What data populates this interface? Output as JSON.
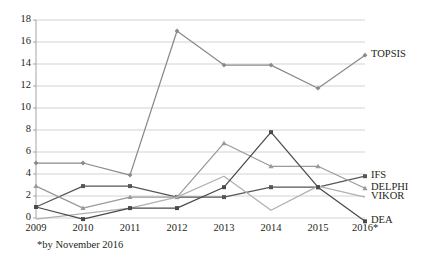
{
  "chart_data": {
    "type": "line",
    "title": "",
    "xlabel": "",
    "ylabel": "",
    "categories": [
      "2009",
      "2010",
      "2011",
      "2012",
      "2013",
      "2014",
      "2015",
      "2016*"
    ],
    "ylim": [
      0,
      18
    ],
    "yticks": [
      0,
      2,
      4,
      6,
      8,
      10,
      12,
      14,
      16,
      18
    ],
    "grid": true,
    "legend_position": "right-inline-end-of-line",
    "footnote": "*by November 2016",
    "series": [
      {
        "name": "TOPSIS",
        "color": "#8a8a8a",
        "marker": "diamond",
        "values": [
          5.0,
          5.0,
          3.9,
          17.0,
          13.9,
          13.9,
          11.8,
          14.8
        ]
      },
      {
        "name": "IFS",
        "color": "#565656",
        "marker": "square",
        "values": [
          1.0,
          2.9,
          2.9,
          1.9,
          1.9,
          2.8,
          2.8,
          3.8
        ]
      },
      {
        "name": "DELPHI",
        "color": "#9a9a9a",
        "marker": "triangle",
        "values": [
          2.9,
          0.9,
          1.9,
          1.9,
          6.8,
          4.7,
          4.7,
          2.7
        ]
      },
      {
        "name": "VIKOR",
        "color": "#b0b0b0",
        "marker": "none",
        "values": [
          -0.1,
          0.4,
          0.9,
          1.9,
          3.8,
          0.7,
          2.9,
          1.9
        ]
      },
      {
        "name": "DEA",
        "color": "#4a4a4a",
        "marker": "square",
        "values": [
          1.0,
          -0.1,
          0.9,
          0.9,
          2.8,
          7.8,
          2.8,
          -0.3
        ]
      }
    ]
  },
  "axis": {
    "y_tick_labels": [
      "18",
      "16",
      "14",
      "12",
      "10",
      "8",
      "6",
      "4",
      "2",
      "0"
    ],
    "x_tick_labels": [
      "2009",
      "2010",
      "2011",
      "2012",
      "2013",
      "2014",
      "2015",
      "2016*"
    ]
  },
  "legend": {
    "entries": [
      {
        "label": "TOPSIS"
      },
      {
        "label": "IFS"
      },
      {
        "label": "DELPHI"
      },
      {
        "label": "VIKOR"
      },
      {
        "label": "DEA"
      }
    ]
  },
  "footnote": {
    "text": "*by November 2016"
  }
}
